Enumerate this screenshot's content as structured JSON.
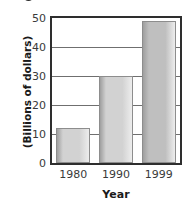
{
  "chart_data": {
    "type": "bar",
    "title": "",
    "title_cropped": true,
    "categories": [
      "1980",
      "1990",
      "1999"
    ],
    "values": [
      12,
      30,
      49
    ],
    "xlabel": "Year",
    "ylabel": "(Billions of dollars)",
    "ylim": [
      0,
      50
    ],
    "yticks": [
      0,
      10,
      20,
      30,
      40,
      50
    ],
    "ytick_labels": [
      "0",
      "10",
      "20",
      "30",
      "40",
      "50"
    ],
    "grid": true,
    "grid_axis": "y",
    "legend": false,
    "series": [
      {
        "name": "",
        "values": [
          12,
          30,
          49
        ]
      }
    ],
    "bar_colors": [
      "#d2d2d2",
      "#d2d2d2",
      "#bfbfbf"
    ],
    "frame_color": "#2e2e2e",
    "grid_color": "#6f6f6f"
  },
  "axes": {
    "y_caption": "(Billions of dollars)",
    "x_caption": "Year"
  },
  "colors": {
    "background": "#ffffff",
    "text": "#1a1a1a",
    "tick_text": "#3a3a3a",
    "bar_light": "#d2d2d2",
    "bar_dark": "#bfbfbf",
    "bar_outline": "#8d8d8d",
    "frame": "#2e2e2e",
    "grid": "#6f6f6f"
  }
}
